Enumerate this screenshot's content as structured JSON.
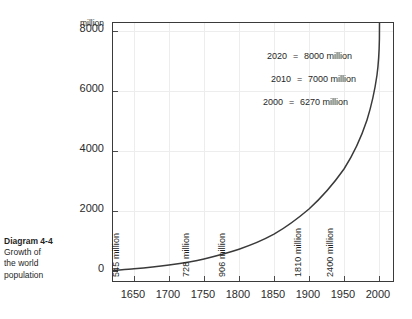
{
  "caption": {
    "title": "Diagram 4-4",
    "lines": [
      "Growth of",
      "the world",
      "population"
    ]
  },
  "chart_data": {
    "type": "line",
    "title": "",
    "xlabel": "",
    "ylabel": "million",
    "unit_label": "million",
    "xlim": [
      1620,
      2020
    ],
    "ylim": [
      0,
      8700
    ],
    "xticks": [
      "1650",
      "1700",
      "1750",
      "1800",
      "1850",
      "1900",
      "1950",
      "2000"
    ],
    "yticks": [
      "0",
      "2000",
      "4000",
      "6000",
      "8000"
    ],
    "grid": true,
    "legend": "none",
    "line_color": "#3a3a3a",
    "x": [
      1650,
      1700,
      1750,
      1800,
      1850,
      1900,
      1950,
      1970,
      1990,
      2000,
      2010,
      2020
    ],
    "values": [
      545,
      610,
      728,
      906,
      1171,
      1608,
      2400,
      3700,
      5300,
      6270,
      7000,
      8000
    ],
    "point_labels": [
      {
        "text": "545 million",
        "year": 1650,
        "value": 545
      },
      {
        "text": "728 million",
        "year": 1750,
        "value": 728
      },
      {
        "text": "906 million",
        "year": 1800,
        "value": 906
      },
      {
        "text": "1810 million",
        "year": 1900,
        "value": 1810
      },
      {
        "text": "2400 million",
        "year": 1950,
        "value": 2400
      }
    ],
    "annotations": [
      {
        "year": "2020",
        "sign": "=",
        "value": "8000 million"
      },
      {
        "year": "2010",
        "sign": "=",
        "value": "7000 million"
      },
      {
        "year": "2000",
        "sign": "=",
        "value": "6270 million"
      }
    ]
  }
}
